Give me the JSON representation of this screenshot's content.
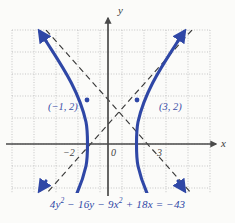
{
  "figure": {
    "background_color": "#fbfbf9",
    "curve_color": "#2f47a6",
    "axis_color": "#4a4a4a",
    "asymptote_color": "#3a3a3a",
    "grid_color": "#b9b9b9"
  },
  "axes": {
    "x_label": "x",
    "y_label": "y",
    "origin_label": "0",
    "x_ticks": [
      {
        "label": "−2",
        "value": -2
      },
      {
        "label": "3",
        "value": 3
      }
    ]
  },
  "annotations": {
    "left_vertex_label": "(−1, 2)",
    "right_vertex_label": "(3, 2)"
  },
  "caption": {
    "equation_parts": [
      {
        "text": "4",
        "sup": ""
      },
      {
        "text": "y",
        "sup": "2"
      },
      {
        "text": " − 16",
        "sup": ""
      },
      {
        "text": "y",
        "sup": ""
      },
      {
        "text": " − 9",
        "sup": ""
      },
      {
        "text": "x",
        "sup": "2"
      },
      {
        "text": " + 18",
        "sup": ""
      },
      {
        "text": "x",
        "sup": ""
      },
      {
        "text": " = −43",
        "sup": ""
      }
    ],
    "equation_plain": "4y² − 16y − 9x² + 18x = −43"
  },
  "chart_data": {
    "type": "line",
    "title": "",
    "subtitle": "",
    "xlabel": "x",
    "ylabel": "y",
    "equation": "4y² − 16y − 9x² + 18x = −43",
    "standard_form": "(x − 1)²/4 − (y − 2)²/9 = 1",
    "conic_type": "hyperbola",
    "orientation": "horizontal",
    "center": [
      1,
      2
    ],
    "a": 2,
    "b": 3,
    "vertices": [
      [
        -1,
        2
      ],
      [
        3,
        2
      ]
    ],
    "vertex_labels": [
      "(−1, 2)",
      "(3, 2)"
    ],
    "asymptotes": [
      {
        "slope": 1.5,
        "intercept": 0.5,
        "equation": "y = 1.5x + 0.5",
        "style": "dashed"
      },
      {
        "slope": -1.5,
        "intercept": 3.5,
        "equation": "y = −1.5x + 3.5",
        "style": "dashed"
      }
    ],
    "xlim": [
      -4.4,
      4.6
    ],
    "ylim": [
      -2.2,
      5.2
    ],
    "grid": true,
    "grid_style": "dotted",
    "grid_step": 1,
    "legend": "none",
    "arrowheads": [
      "left-branch-top",
      "left-branch-bottom",
      "right-branch-top",
      "right-branch-bottom"
    ],
    "x_tick_labels": [
      "−2",
      "0",
      "3"
    ],
    "x_tick_values": [
      -2,
      0,
      3
    ],
    "y_tick_labels": [],
    "series": [
      {
        "name": "left branch",
        "points": [
          [
            -1.0,
            2.0
          ],
          [
            -1.04,
            2.6
          ],
          [
            -1.16,
            3.2
          ],
          [
            -1.35,
            3.8
          ],
          [
            -1.6,
            4.35
          ],
          [
            -1.9,
            4.85
          ],
          [
            -2.12,
            5.2
          ],
          [
            -1.04,
            1.4
          ],
          [
            -1.16,
            0.8
          ],
          [
            -1.35,
            0.2
          ],
          [
            -1.6,
            -0.35
          ],
          [
            -1.9,
            -0.85
          ],
          [
            -2.12,
            -1.2
          ]
        ]
      },
      {
        "name": "right branch",
        "points": [
          [
            3.0,
            2.0
          ],
          [
            3.04,
            2.6
          ],
          [
            3.16,
            3.2
          ],
          [
            3.35,
            3.8
          ],
          [
            3.6,
            4.35
          ],
          [
            3.9,
            4.85
          ],
          [
            4.12,
            5.2
          ],
          [
            3.04,
            1.4
          ],
          [
            3.16,
            0.8
          ],
          [
            3.35,
            0.2
          ],
          [
            3.6,
            -0.35
          ],
          [
            3.9,
            -0.85
          ],
          [
            4.12,
            -1.2
          ]
        ]
      }
    ]
  }
}
